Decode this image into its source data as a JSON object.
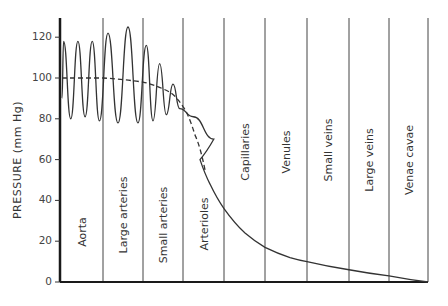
{
  "chart_data": {
    "type": "line",
    "title": "",
    "xlabel": "",
    "ylabel": "PRESSURE (mm Hg)",
    "ylim": [
      0,
      130
    ],
    "yticks": [
      0,
      20,
      40,
      60,
      80,
      100,
      120
    ],
    "grid": false,
    "legend": null,
    "segments": [
      "Aorta",
      "Large arteries",
      "Small arteries",
      "Arterioles",
      "Capillaries",
      "Venules",
      "Small veins",
      "Large veins",
      "Venae cavae"
    ],
    "series": [
      {
        "name": "Pulsatile pressure",
        "style": "solid",
        "systolic_peaks": [
          {
            "segment": "Aorta",
            "values": [
              118,
              118,
              118
            ]
          },
          {
            "segment": "Large arteries",
            "values": [
              122,
              125
            ]
          },
          {
            "segment": "Small arteries",
            "values": [
              116,
              107,
              97
            ]
          },
          {
            "segment": "Arterioles",
            "values": [
              81
            ]
          }
        ],
        "diastolic_troughs": [
          {
            "segment": "Aorta",
            "values": [
              80,
              81,
              79
            ]
          },
          {
            "segment": "Large arteries",
            "values": [
              78,
              78
            ]
          },
          {
            "segment": "Small arteries",
            "values": [
              79,
              82,
              85
            ]
          },
          {
            "segment": "Arterioles",
            "values": [
              70
            ]
          }
        ],
        "nonpulsatile_values": [
          {
            "segment": "Arterioles",
            "start": 60,
            "end": 36
          },
          {
            "segment": "Capillaries",
            "start": 36,
            "end": 18
          },
          {
            "segment": "Venules",
            "start": 18,
            "end": 10
          },
          {
            "segment": "Small veins",
            "start": 10,
            "end": 6
          },
          {
            "segment": "Large veins",
            "start": 6,
            "end": 3
          },
          {
            "segment": "Venae cavae",
            "start": 3,
            "end": 0
          }
        ]
      },
      {
        "name": "Mean pressure",
        "style": "dashed",
        "points": [
          {
            "segment": "Aorta",
            "value": 100
          },
          {
            "segment": "Large arteries",
            "value": 99
          },
          {
            "segment": "Small arteries",
            "value": 94
          },
          {
            "segment": "Arterioles (start)",
            "value": 85
          },
          {
            "segment": "Arterioles (end)",
            "value": 40
          }
        ]
      }
    ]
  }
}
